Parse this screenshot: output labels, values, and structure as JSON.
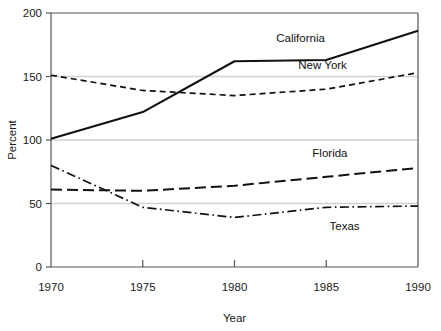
{
  "chart_data": {
    "type": "line",
    "title": "",
    "xlabel": "Year",
    "ylabel": "Percent",
    "x": [
      1970,
      1975,
      1980,
      1985,
      1990
    ],
    "xlim": [
      1970,
      1990
    ],
    "ylim": [
      0,
      200
    ],
    "xticks": [
      "1970",
      "1975",
      "1980",
      "1985",
      "1990"
    ],
    "yticks": [
      "0",
      "50",
      "100",
      "150",
      "200"
    ],
    "grid": "horizontal gridlines at 50, 100, 150",
    "gridlines": [
      50,
      100,
      150
    ],
    "legend_position": "inline labels at right of each series",
    "series": [
      {
        "name": "California",
        "style": "solid",
        "values": [
          101,
          122,
          162,
          163,
          186
        ],
        "label_x": 1983.6,
        "label_y": 180
      },
      {
        "name": "New York",
        "style": "dashed-short",
        "values": [
          151,
          139,
          135,
          140,
          153
        ],
        "label_x": 1984.8,
        "label_y": 159
      },
      {
        "name": "Florida",
        "style": "dashed-long",
        "values": [
          61,
          60,
          64,
          71,
          78
        ],
        "label_x": 1985.2,
        "label_y": 90
      },
      {
        "name": "Texas",
        "style": "dash-dot",
        "values": [
          80,
          47,
          39,
          47,
          48
        ],
        "label_x": 1986.0,
        "label_y": 32
      }
    ]
  },
  "colors": {
    "line": "#111111",
    "axis": "#555555",
    "grid": "#d0d0d0",
    "text": "#1a1a1a",
    "background": "#ffffff"
  }
}
